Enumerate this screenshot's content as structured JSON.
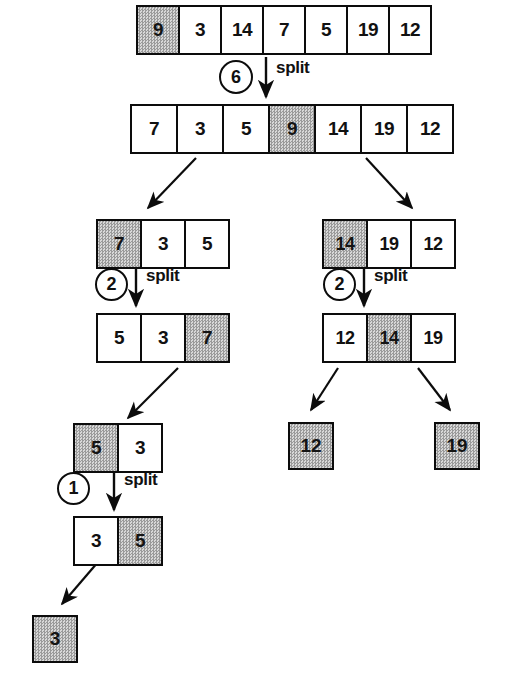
{
  "diagram": {
    "split_label": "split",
    "colors": {
      "stroke": "#0c0c0c",
      "shaded_dark": "#9a9a9a",
      "shaded_light": "#d8d8d8",
      "background": "#ffffff",
      "text": "#111111"
    }
  },
  "levels": [
    {
      "id": "root-before",
      "name": "root-array-before-split",
      "cells": [
        {
          "value": "9",
          "shaded": true
        },
        {
          "value": "3",
          "shaded": false
        },
        {
          "value": "14",
          "shaded": false
        },
        {
          "value": "7",
          "shaded": false
        },
        {
          "value": "5",
          "shaded": false
        },
        {
          "value": "19",
          "shaded": false
        },
        {
          "value": "12",
          "shaded": false
        }
      ]
    },
    {
      "id": "root-after",
      "name": "root-array-after-split",
      "cells": [
        {
          "value": "7",
          "shaded": false
        },
        {
          "value": "3",
          "shaded": false
        },
        {
          "value": "5",
          "shaded": false
        },
        {
          "value": "9",
          "shaded": true
        },
        {
          "value": "14",
          "shaded": false
        },
        {
          "value": "19",
          "shaded": false
        },
        {
          "value": "12",
          "shaded": false
        }
      ]
    },
    {
      "id": "left-before",
      "name": "left-subarray-before-split",
      "cells": [
        {
          "value": "7",
          "shaded": true
        },
        {
          "value": "3",
          "shaded": false
        },
        {
          "value": "5",
          "shaded": false
        }
      ]
    },
    {
      "id": "left-after",
      "name": "left-subarray-after-split",
      "cells": [
        {
          "value": "5",
          "shaded": false
        },
        {
          "value": "3",
          "shaded": false
        },
        {
          "value": "7",
          "shaded": true
        }
      ]
    },
    {
      "id": "right-before",
      "name": "right-subarray-before-split",
      "cells": [
        {
          "value": "14",
          "shaded": true
        },
        {
          "value": "19",
          "shaded": false
        },
        {
          "value": "12",
          "shaded": false
        }
      ]
    },
    {
      "id": "right-after",
      "name": "right-subarray-after-split",
      "cells": [
        {
          "value": "12",
          "shaded": false
        },
        {
          "value": "14",
          "shaded": true
        },
        {
          "value": "19",
          "shaded": false
        }
      ]
    },
    {
      "id": "leftleft-before",
      "name": "left-left-subarray-before-split",
      "cells": [
        {
          "value": "5",
          "shaded": true
        },
        {
          "value": "3",
          "shaded": false
        }
      ]
    },
    {
      "id": "leftleft-after",
      "name": "left-left-subarray-after-split",
      "cells": [
        {
          "value": "3",
          "shaded": false
        },
        {
          "value": "5",
          "shaded": true
        }
      ]
    }
  ],
  "leaves": [
    {
      "id": "leaf-12",
      "name": "leaf-node-12",
      "value": "12"
    },
    {
      "id": "leaf-19",
      "name": "leaf-node-19",
      "value": "19"
    },
    {
      "id": "leaf-3",
      "name": "leaf-node-3",
      "value": "3"
    }
  ],
  "counters": [
    {
      "id": "counter-root",
      "name": "comparison-count-root",
      "value": "6"
    },
    {
      "id": "counter-left",
      "name": "comparison-count-left",
      "value": "2"
    },
    {
      "id": "counter-right",
      "name": "comparison-count-right",
      "value": "2"
    },
    {
      "id": "counter-leftleft",
      "name": "comparison-count-leftleft",
      "value": "1"
    }
  ],
  "split_labels": [
    {
      "id": "split-root",
      "text": "split"
    },
    {
      "id": "split-left",
      "text": "split"
    },
    {
      "id": "split-right",
      "text": "split"
    },
    {
      "id": "split-leftleft",
      "text": "split"
    }
  ]
}
